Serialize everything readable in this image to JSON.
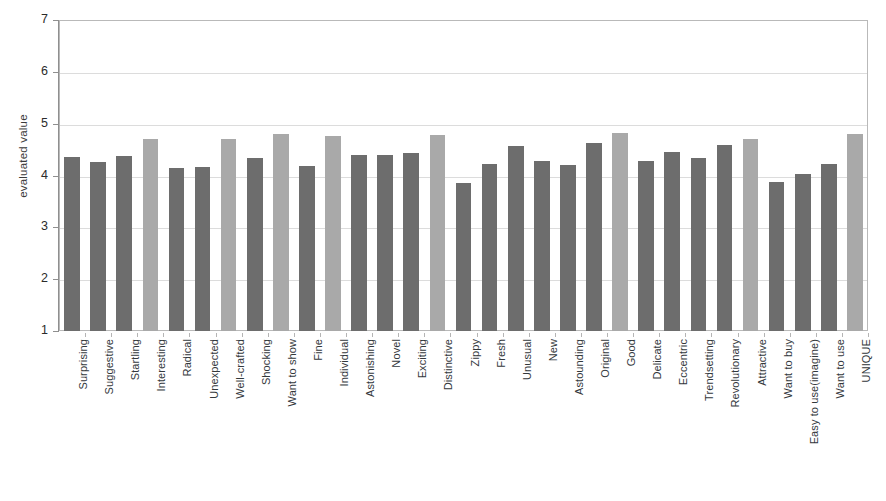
{
  "chart_data": {
    "type": "bar",
    "title": "",
    "xlabel": "",
    "ylabel": "evaluated value",
    "ylim": [
      1,
      7
    ],
    "yticks": [
      1,
      2,
      3,
      4,
      5,
      6,
      7
    ],
    "grid": true,
    "legend": "none",
    "categories": [
      "Surprising",
      "Suggestive",
      "Startling",
      "Interesting",
      "Radical",
      "Unexpected",
      "Well-crafted",
      "Shocking",
      "Want to show",
      "Fine",
      "Individual",
      "Astonishing",
      "Novel",
      "Exciting",
      "Distinctive",
      "Zippy",
      "Fresh",
      "Unusual",
      "New",
      "Astounding",
      "Original",
      "Good",
      "Delicate",
      "Eccentric",
      "Trendsetting",
      "Revolutionary",
      "Attractive",
      "Want to buy",
      "Easy to use(imagine)",
      "Want to use",
      "UNIQUE"
    ],
    "values": [
      4.35,
      4.26,
      4.38,
      4.7,
      4.15,
      4.16,
      4.7,
      4.33,
      4.8,
      4.19,
      4.77,
      4.39,
      4.39,
      4.43,
      4.78,
      3.86,
      4.23,
      4.56,
      4.28,
      4.21,
      4.63,
      4.82,
      4.28,
      4.46,
      4.33,
      4.58,
      4.7,
      3.88,
      4.02,
      4.22,
      4.81
    ],
    "highlighted": [
      "Interesting",
      "Well-crafted",
      "Want to show",
      "Individual",
      "Distinctive",
      "Good",
      "Attractive",
      "UNIQUE"
    ],
    "colors": {
      "bar_default": "#6d6d6d",
      "bar_highlight": "#a9a9a9",
      "gridline": "#dcdcdc",
      "axis": "#8f8f8f",
      "plot_border": "#b9b9b9",
      "text": "#2b2b2b"
    }
  }
}
